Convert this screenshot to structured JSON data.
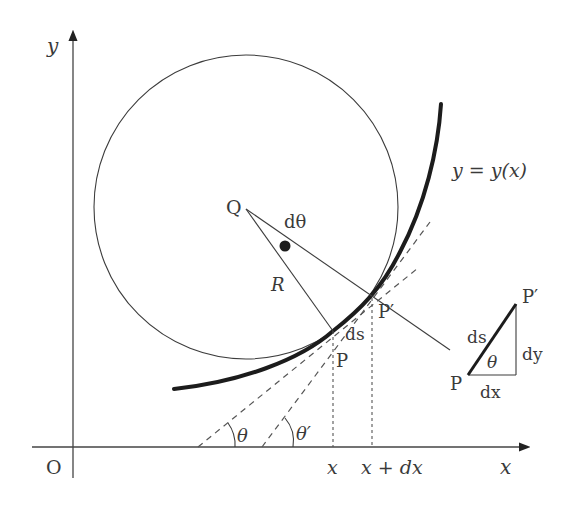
{
  "figure": {
    "axes": {
      "x_label": "x",
      "y_label": "y",
      "origin_label": "O"
    },
    "curve": {
      "label": "y = y(x)"
    },
    "circle": {
      "center_label": "Q",
      "radius_label": "R",
      "angle_label": "dθ"
    },
    "points": {
      "p": "P",
      "p_prime": "P′",
      "arc_label": "ds"
    },
    "tangent_angles": {
      "theta": "θ",
      "theta_prime": "θ′"
    },
    "x_ticks": {
      "x": "x",
      "x_plus_dx": "x + dx"
    },
    "inset_triangle": {
      "p": "P",
      "p_prime": "P′",
      "hypotenuse": "ds",
      "base": "dx",
      "height": "dy",
      "angle": "θ"
    }
  }
}
